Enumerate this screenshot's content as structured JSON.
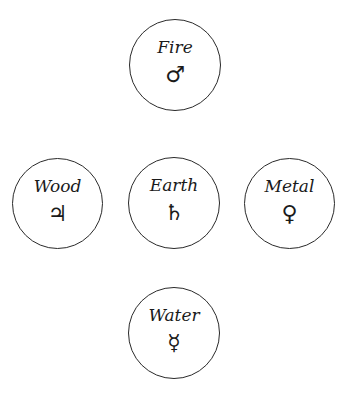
{
  "diagram": {
    "title": "",
    "elements": [
      {
        "id": "fire",
        "label": "Fire",
        "symbol": "♂",
        "symbol_name": "mars-icon"
      },
      {
        "id": "wood",
        "label": "Wood",
        "symbol": "♃",
        "symbol_name": "jupiter-icon"
      },
      {
        "id": "earth",
        "label": "Earth",
        "symbol": "♄",
        "symbol_name": "saturn-icon"
      },
      {
        "id": "metal",
        "label": "Metal",
        "symbol": "♀",
        "symbol_name": "venus-icon"
      },
      {
        "id": "water",
        "label": "Water",
        "symbol": "☿",
        "symbol_name": "mercury-icon"
      }
    ],
    "colors": {
      "stroke": "#2a2a2a",
      "text": "#1a1a1a",
      "background": "#ffffff"
    }
  }
}
